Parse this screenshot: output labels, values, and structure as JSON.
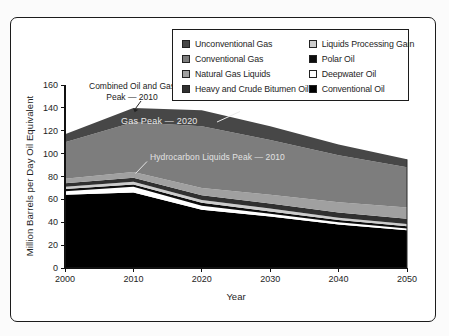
{
  "figure": {
    "y_axis_title": "Million Barrels per Day Oil Equivalent",
    "x_axis_title": "Year"
  },
  "legend": {
    "columns": [
      {
        "items": [
          {
            "label": "Unconventional Gas",
            "color": "#474747"
          },
          {
            "label": "Conventional Gas",
            "color": "#7d7d7d"
          },
          {
            "label": "Natural Gas Liquids",
            "color": "#a0a0a0"
          },
          {
            "label": "Heavy and Crude Bitumen Oil",
            "color": "#303030"
          }
        ]
      },
      {
        "items": [
          {
            "label": "Liquids Processing Gain",
            "color": "#cccccc"
          },
          {
            "label": "Polar Oil",
            "color": "#0d0d0d"
          },
          {
            "label": "Deepwater Oil",
            "color": "#ffffff"
          },
          {
            "label": "Conventional Oil",
            "color": "#000000"
          }
        ]
      }
    ]
  },
  "annotations": {
    "combined_line1": "Combined Oil and Gas",
    "combined_line2": "Peak — 2010",
    "gas": "Gas Peak — 2020",
    "liquids": "Hydrocarbon Liquids Peak — 2010"
  },
  "chart_data": {
    "type": "area",
    "stacked": true,
    "title": "",
    "xlabel": "Year",
    "ylabel": "Million Barrels per Day Oil Equivalent",
    "x": [
      2000,
      2010,
      2020,
      2030,
      2040,
      2050
    ],
    "xlim": [
      2000,
      2050
    ],
    "ylim": [
      0,
      160
    ],
    "y_ticks": [
      0,
      20,
      40,
      60,
      80,
      100,
      120,
      140,
      160
    ],
    "grid": false,
    "legend_position": "top-right box, two columns",
    "series_order_note": "listed bottom-to-top in the stack",
    "series": [
      {
        "name": "Conventional Oil",
        "color": "#000000",
        "values": [
          64,
          66,
          51,
          45,
          38,
          33
        ]
      },
      {
        "name": "Deepwater Oil",
        "color": "#ffffff",
        "values": [
          3,
          5,
          3.5,
          2.5,
          2,
          1.5
        ]
      },
      {
        "name": "Polar Oil",
        "color": "#0d0d0d",
        "values": [
          2,
          2,
          2.5,
          2,
          2,
          2
        ]
      },
      {
        "name": "Liquids Processing Gain",
        "color": "#cccccc",
        "values": [
          2,
          2.5,
          2.5,
          2.5,
          2,
          2
        ]
      },
      {
        "name": "Heavy and Crude Bitumen Oil",
        "color": "#303030",
        "values": [
          3,
          3.5,
          4,
          4.5,
          4.5,
          4.5
        ]
      },
      {
        "name": "Natural Gas Liquids",
        "color": "#a0a0a0",
        "values": [
          4,
          5,
          6.5,
          7.5,
          9,
          10
        ]
      },
      {
        "name": "Conventional Gas",
        "color": "#7d7d7d",
        "values": [
          32,
          43.5,
          54,
          48,
          41,
          35
        ]
      },
      {
        "name": "Unconventional Gas",
        "color": "#474747",
        "values": [
          7,
          12.5,
          14,
          12,
          9.5,
          7
        ]
      }
    ],
    "stack_totals": [
      117,
      140,
      138,
      124,
      108,
      95
    ],
    "annotations": [
      {
        "text": "Combined Oil and Gas Peak — 2010",
        "points_to": {
          "year": 2010,
          "value": 140
        }
      },
      {
        "text": "Gas Peak — 2020",
        "points_to": {
          "year": 2020,
          "value": 138
        }
      },
      {
        "text": "Hydrocarbon Liquids Peak — 2010",
        "points_to": {
          "year": 2010,
          "value": 84
        }
      }
    ]
  }
}
